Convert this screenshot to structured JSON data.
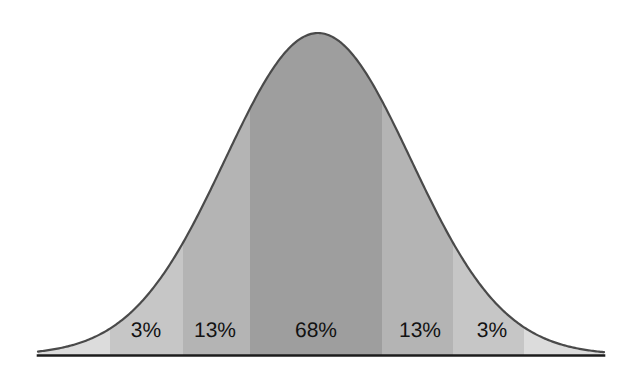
{
  "figure": {
    "kind": "normal-distribution-bell-curve",
    "width": 628,
    "height": 378,
    "background_color": "#ffffff",
    "curve_outline_color": "#4a4a4a",
    "baseline_color": "#1c1c1c",
    "label_color": "#121212"
  },
  "chart_data": {
    "type": "area",
    "title": "",
    "subtitle": "",
    "xlabel": "",
    "ylabel": "",
    "grid": false,
    "legend_position": "none",
    "distribution": "normal",
    "mean_x_px": 318,
    "std_dev_px": 93,
    "baseline_y_px": 355,
    "peak_y_px": 33,
    "axis_x_start_px": 38,
    "axis_x_end_px": 604,
    "categories": [
      "3%",
      "13%",
      "68%",
      "13%",
      "3%"
    ],
    "values": [
      3,
      13,
      68,
      13,
      3
    ],
    "bands": [
      {
        "name": "left-outer-tail",
        "label": "",
        "value": null,
        "x_start_px": 38,
        "x_end_px": 110,
        "fill": "#dcdcdc"
      },
      {
        "name": "left-3-percent",
        "label": "3%",
        "value": 3,
        "x_start_px": 110,
        "x_end_px": 183,
        "fill": "#c6c6c6",
        "label_x_px": 146,
        "label_y_px": 330
      },
      {
        "name": "left-13-percent",
        "label": "13%",
        "value": 13,
        "x_start_px": 183,
        "x_end_px": 250,
        "fill": "#b4b4b4",
        "label_x_px": 215,
        "label_y_px": 330
      },
      {
        "name": "center-68-percent",
        "label": "68%",
        "value": 68,
        "x_start_px": 250,
        "x_end_px": 382,
        "fill": "#9e9e9e",
        "label_x_px": 316,
        "label_y_px": 330
      },
      {
        "name": "right-13-percent",
        "label": "13%",
        "value": 13,
        "x_start_px": 382,
        "x_end_px": 453,
        "fill": "#b4b4b4",
        "label_x_px": 420,
        "label_y_px": 330
      },
      {
        "name": "right-3-percent",
        "label": "3%",
        "value": 3,
        "x_start_px": 453,
        "x_end_px": 524,
        "fill": "#c6c6c6",
        "label_x_px": 492,
        "label_y_px": 330
      },
      {
        "name": "right-outer-tail",
        "label": "",
        "value": null,
        "x_start_px": 524,
        "x_end_px": 604,
        "fill": "#dcdcdc"
      }
    ]
  }
}
